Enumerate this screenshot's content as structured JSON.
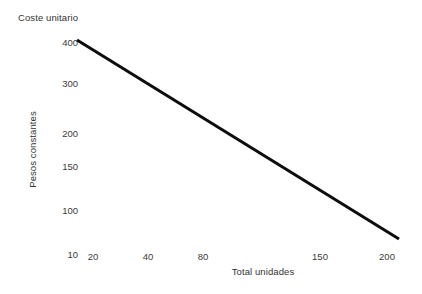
{
  "chart_data": {
    "type": "line",
    "title": "Coste unitario",
    "xlabel": "Total unidades",
    "ylabel": "Pesos constantes",
    "grid": false,
    "legend": null,
    "x_tick_labels": [
      "20",
      "40",
      "80",
      "150",
      "200"
    ],
    "y_tick_labels": [
      "400",
      "300",
      "200",
      "150",
      "100",
      "10"
    ],
    "x_ticks": [
      20,
      40,
      80,
      150,
      200
    ],
    "y_ticks": [
      400,
      300,
      200,
      150,
      100,
      10
    ],
    "xlim": [
      10,
      210
    ],
    "ylim": [
      10,
      420
    ],
    "series": [
      {
        "name": "Coste unitario",
        "color": "#0d0d0d",
        "x": [
          20,
          200
        ],
        "values": [
          400,
          30
        ]
      }
    ],
    "annotations": []
  },
  "axes": {
    "title": "Coste unitario",
    "x_title": "Total unidades",
    "y_title": "Pesos constantes",
    "y_labels": [
      {
        "text": "400",
        "top": 37
      },
      {
        "text": "300",
        "top": 78
      },
      {
        "text": "200",
        "top": 128
      },
      {
        "text": "150",
        "top": 161
      },
      {
        "text": "100",
        "top": 205
      },
      {
        "text": "10",
        "top": 249
      }
    ],
    "x_labels": [
      {
        "text": "20",
        "left": 73
      },
      {
        "text": "40",
        "left": 128
      },
      {
        "text": "80",
        "left": 183
      },
      {
        "text": "150",
        "left": 300
      },
      {
        "text": "200",
        "left": 367
      }
    ]
  },
  "line_geometry": {
    "x1": 77,
    "y1": 40,
    "x2": 399,
    "y2": 239,
    "color": "#0d0d0d",
    "width": 3
  }
}
